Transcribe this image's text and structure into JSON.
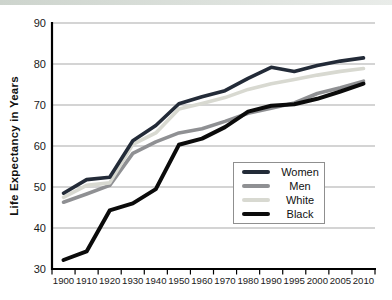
{
  "page": {
    "background": "#ffffff",
    "top_strip_color": "#cdd4cd"
  },
  "chart_data": {
    "type": "line",
    "title": "",
    "xlabel": "",
    "ylabel": "Life Expectancy in Years",
    "x_labels": [
      "1900",
      "1910",
      "1920",
      "1930",
      "1940",
      "1950",
      "1960",
      "1970",
      "1980",
      "1990",
      "1995",
      "2000",
      "2005",
      "2010"
    ],
    "y_ticks": [
      30,
      40,
      50,
      60,
      70,
      80,
      90
    ],
    "ylim": [
      30,
      90
    ],
    "grid": "horizontal",
    "legend_position": "inside-lower-right",
    "axis_color": "#000000",
    "gridline_color": "#a9a9a9",
    "series": [
      {
        "name": "Women",
        "color": "#232b38",
        "values": [
          48.5,
          51.8,
          52.4,
          61.3,
          65.0,
          70.3,
          72.0,
          73.5,
          76.5,
          79.2,
          78.2,
          79.6,
          80.7,
          81.5
        ]
      },
      {
        "name": "Men",
        "color": "#8f9093",
        "values": [
          46.3,
          48.3,
          50.4,
          58.2,
          61.0,
          63.2,
          64.2,
          66.0,
          68.0,
          69.2,
          70.5,
          72.8,
          74.2,
          75.8
        ]
      },
      {
        "name": "White",
        "color": "#d8d9d1",
        "values": [
          47.5,
          50.4,
          51.0,
          60.4,
          63.2,
          69.0,
          70.4,
          71.8,
          73.8,
          75.2,
          76.2,
          77.3,
          78.2,
          78.9
        ]
      },
      {
        "name": "Black",
        "color": "#0b0b0b",
        "values": [
          32.2,
          34.3,
          44.3,
          46.0,
          49.5,
          60.3,
          61.8,
          64.6,
          68.4,
          69.8,
          70.2,
          71.5,
          73.3,
          75.2
        ]
      }
    ]
  }
}
